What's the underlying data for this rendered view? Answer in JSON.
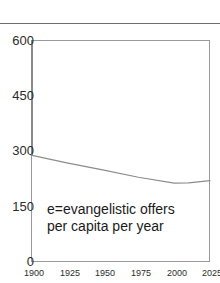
{
  "chart_data": {
    "type": "line",
    "title": "",
    "subtitle": "",
    "xlabel": "",
    "ylabel": "",
    "xlim": [
      1900,
      2025
    ],
    "ylim": [
      0,
      600
    ],
    "grid": false,
    "legend_position": "none",
    "y_ticks": [
      "600",
      "450",
      "300",
      "150",
      "0"
    ],
    "y_tick_values": [
      600,
      450,
      300,
      150,
      0
    ],
    "x_ticks": [
      "1900",
      "1925",
      "1950",
      "1975",
      "2000",
      "2025"
    ],
    "x_tick_values": [
      1900,
      1925,
      1950,
      1975,
      2000,
      2025
    ],
    "annotations": [
      {
        "name": "series-legend-note",
        "line1": "e=evangelistic offers",
        "line2": "per capita per year"
      }
    ],
    "series": [
      {
        "name": "e",
        "description": "evangelistic offers per capita per year",
        "color": "#8c8c8c",
        "x": [
          1900,
          1925,
          1950,
          1975,
          2000,
          2010,
          2025
        ],
        "values": [
          289,
          268,
          249,
          229,
          213,
          214,
          220
        ]
      }
    ]
  },
  "colors": {
    "line": "#8c8c8c",
    "frame": "#9a9a9a",
    "rule": "#6e6e6e",
    "text": "#2b2b2b",
    "annotation_text": "#1a1a1a"
  }
}
